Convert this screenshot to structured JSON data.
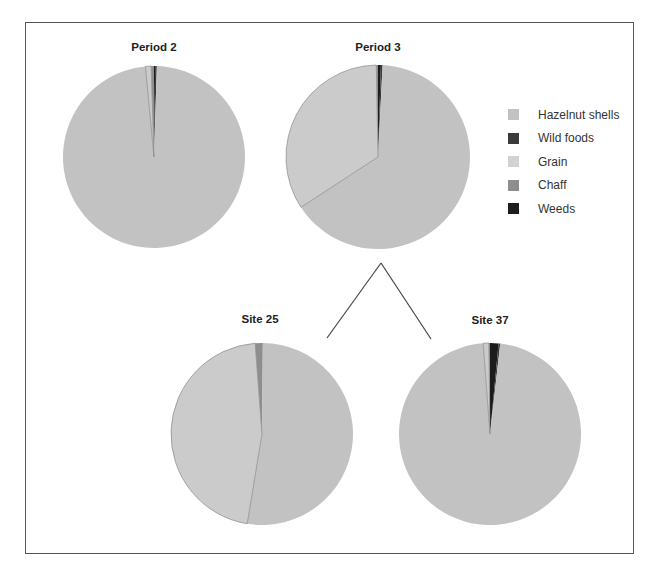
{
  "chart_data": {
    "type": "pie",
    "legend": [
      {
        "name": "Hazelnut shells",
        "color": "#c2c2c2"
      },
      {
        "name": "Wild foods",
        "color": "#3a3a3a"
      },
      {
        "name": "Grain",
        "color": "#cfcfcf"
      },
      {
        "name": "Chaff",
        "color": "#8e8e8e"
      },
      {
        "name": "Weeds",
        "color": "#1c1c1c"
      }
    ],
    "legend_position": "right",
    "pies": [
      {
        "title": "Period 2",
        "cx": 154,
        "cy": 157,
        "r": 91,
        "values": {
          "Hazelnut shells": 98.0,
          "Wild foods": 0.3,
          "Grain": 1.0,
          "Chaff": 0.5,
          "Weeds": 0.2
        }
      },
      {
        "title": "Period 3",
        "cx": 378,
        "cy": 157,
        "r": 92,
        "values": {
          "Hazelnut shells": 65.0,
          "Wild foods": 0.3,
          "Grain": 33.9,
          "Chaff": 0.3,
          "Weeds": 0.5
        }
      },
      {
        "title": "Site 25",
        "cx": 262,
        "cy": 434,
        "r": 91,
        "values": {
          "Hazelnut shells": 52.5,
          "Wild foods": 0.1,
          "Grain": 46.2,
          "Chaff": 1.2,
          "Weeds": 0.0
        }
      },
      {
        "title": "Site 37",
        "cx": 490,
        "cy": 434,
        "r": 91,
        "values": {
          "Hazelnut shells": 97.0,
          "Wild foods": 0.3,
          "Grain": 1.0,
          "Chaff": 0.2,
          "Weeds": 1.5
        }
      }
    ],
    "connectors": [
      {
        "from": [
          381,
          263
        ],
        "to": [
          327,
          338
        ]
      },
      {
        "from": [
          381,
          263
        ],
        "to": [
          431,
          339
        ]
      }
    ]
  },
  "titles": {
    "p2": "Period 2",
    "p3": "Period 3",
    "s25": "Site 25",
    "s37": "Site 37"
  },
  "legend": {
    "hazelnut": "Hazelnut shells",
    "wild": "Wild foods",
    "grain": "Grain",
    "chaff": "Chaff",
    "weeds": "Weeds"
  }
}
